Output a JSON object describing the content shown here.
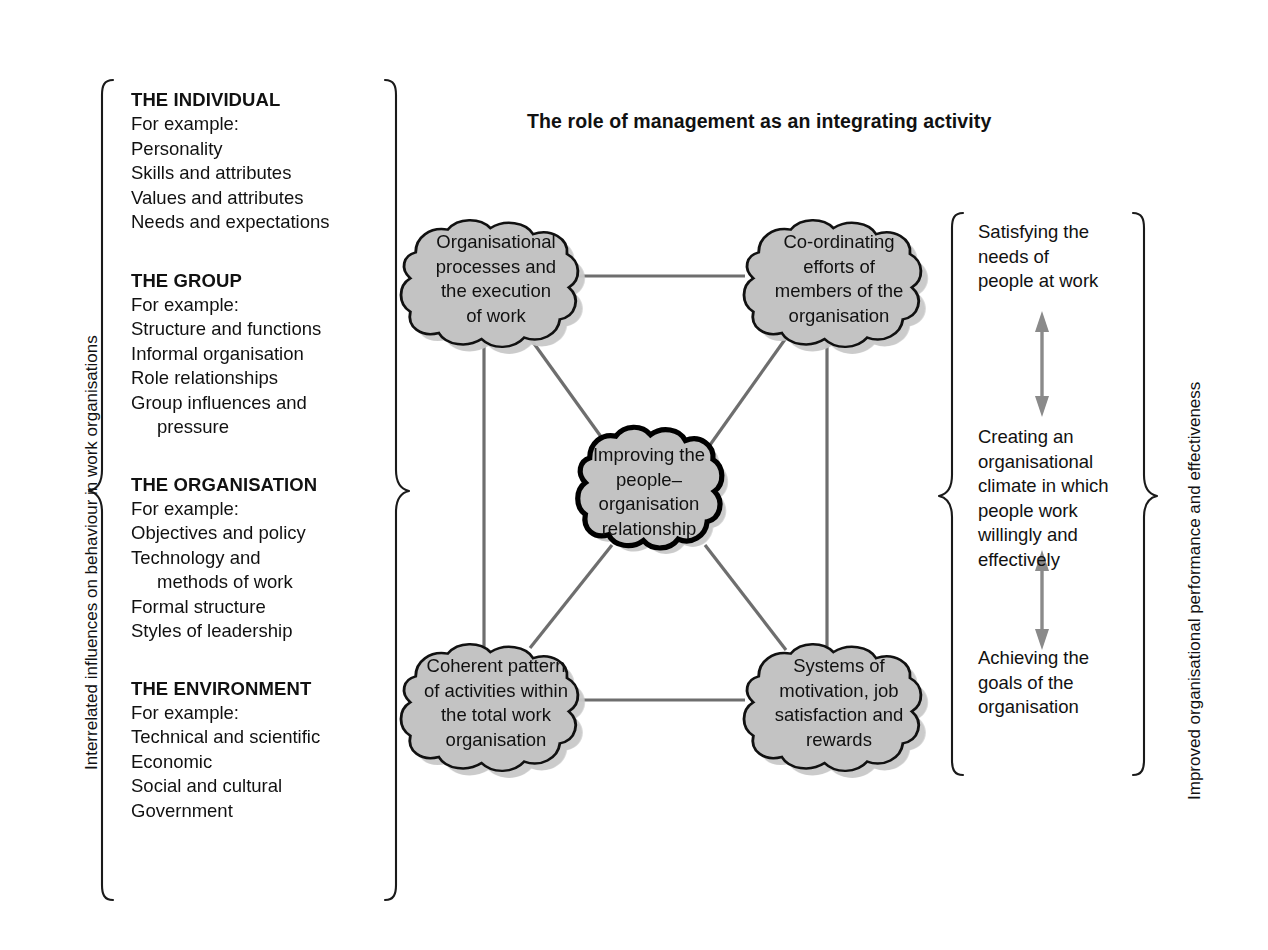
{
  "figure": {
    "title": "The role of management as an integrating activity",
    "left_caption": "Interrelated influences on behaviour in work organisations",
    "right_caption": "Improved organisational performance and effectiveness"
  },
  "left_column": {
    "groups": [
      {
        "heading": "THE INDIVIDUAL",
        "lead": "For example:",
        "items": [
          "Personality",
          "Skills and attributes",
          "Values and attributes",
          "Needs and expectations"
        ]
      },
      {
        "heading": "THE GROUP",
        "lead": "For example:",
        "items": [
          "Structure and functions",
          "Informal organisation",
          "Role relationships",
          "Group influences and",
          "pressure"
        ]
      },
      {
        "heading": "THE ORGANISATION",
        "lead": "For example:",
        "items": [
          "Objectives and policy",
          "Technology and",
          "methods of work",
          "Formal structure",
          "Styles of leadership"
        ]
      },
      {
        "heading": "THE ENVIRONMENT",
        "lead": "For example:",
        "items": [
          "Technical and scientific",
          "Economic",
          "Social and cultural",
          "Government"
        ]
      }
    ]
  },
  "diagram": {
    "nodes": {
      "top_left": "Organisational\nprocesses and\nthe execution\nof work",
      "top_right": "Co-ordinating\nefforts of\nmembers of the\norganisation",
      "centre": "Improving the\npeople–\norganisation\nrelationship",
      "bottom_left": "Coherent pattern\nof activities within\nthe total work\norganisation",
      "bottom_right": "Systems of\nmotivation, job\nsatisfaction and\nrewards"
    },
    "node_fill": "#c3c3c3",
    "node_stroke": "#111111",
    "connector_color": "#6e6e6e",
    "shadow_color": "#bdbdbd"
  },
  "right_column": {
    "outcomes": [
      "Satisfying the\nneeds of\npeople at work",
      "Creating an\norganisational\nclimate in which\npeople work\nwillingly and\neffectively",
      "Achieving the\ngoals of the\norganisation"
    ],
    "arrow_color": "#8a8a8a"
  }
}
